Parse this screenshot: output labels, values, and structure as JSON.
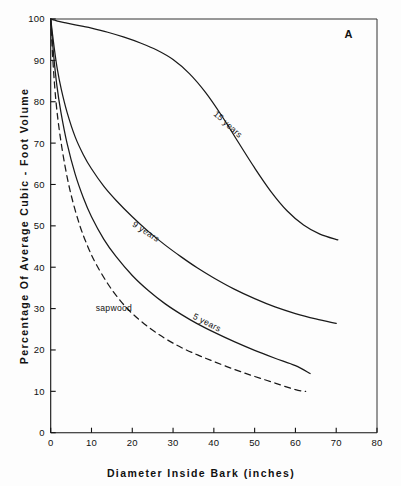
{
  "figure": {
    "panel_label": "A",
    "background_color": "#fdfdfd",
    "line_color": "#1a1a1a"
  },
  "chart_data": {
    "type": "line",
    "title": "",
    "xlabel": "Diameter Inside Bark  (inches)",
    "ylabel": "Percentage Of  Average Cubic - Foot  Volume",
    "xlim": [
      0,
      80
    ],
    "ylim": [
      0,
      100
    ],
    "xticks": [
      0,
      10,
      20,
      30,
      40,
      50,
      60,
      70,
      80
    ],
    "xticklabels": [
      "0",
      "10",
      "20",
      "30",
      "40",
      "50",
      "60",
      "70",
      "80"
    ],
    "yticks": [
      0,
      10,
      20,
      30,
      40,
      50,
      60,
      70,
      80,
      90,
      100
    ],
    "yticklabels": [
      "0",
      "10",
      "20",
      "30",
      "40",
      "50",
      "60",
      "70",
      "80",
      "90",
      "100"
    ],
    "grid": false,
    "legend": "inline-curve-labels",
    "annotations": [
      {
        "text": "A",
        "x": 73,
        "y": 95.5
      }
    ],
    "series": [
      {
        "name": "15 years",
        "label": "15 years",
        "style": "solid",
        "label_x": 43,
        "label_y": 74,
        "label_rotation": 42,
        "x": [
          0,
          1,
          2,
          4,
          6,
          8,
          10,
          14,
          18,
          22,
          26,
          30,
          34,
          38,
          42,
          46,
          50,
          54,
          58,
          62,
          66,
          70.4
        ],
        "y": [
          100,
          99.7,
          99.4,
          99.0,
          98.6,
          98.2,
          97.8,
          96.8,
          95.6,
          94.2,
          92.5,
          90.2,
          86.8,
          82.2,
          76.5,
          70.2,
          64.0,
          58.3,
          53.6,
          50.2,
          48.0,
          46.6
        ]
      },
      {
        "name": "9 years",
        "label": "9 years",
        "style": "solid",
        "label_x": 23,
        "label_y": 48,
        "label_rotation": 33,
        "x": [
          0,
          0.8,
          1.6,
          2.6,
          4,
          6,
          8,
          10,
          13,
          16,
          20,
          24,
          28,
          32,
          36,
          40,
          45,
          50,
          55,
          60,
          65,
          70
        ],
        "y": [
          100,
          93.5,
          88.0,
          83.0,
          77.5,
          71.5,
          67.2,
          63.8,
          59.6,
          56.2,
          52.2,
          48.6,
          45.4,
          42.5,
          39.8,
          37.4,
          34.7,
          32.4,
          30.4,
          28.8,
          27.5,
          26.4
        ]
      },
      {
        "name": "5 years",
        "label": "5 years",
        "style": "solid",
        "label_x": 38,
        "label_y": 26,
        "label_rotation": 27,
        "x": [
          0,
          0.7,
          1.5,
          2.5,
          4,
          6,
          8,
          10,
          13,
          16,
          20,
          24,
          28,
          32,
          36,
          40,
          45,
          50,
          55,
          60,
          63.6
        ],
        "y": [
          100,
          91.5,
          84.0,
          77.5,
          70.0,
          62.5,
          56.8,
          52.2,
          46.8,
          42.6,
          38.0,
          34.3,
          31.2,
          28.6,
          26.3,
          24.3,
          22.0,
          19.9,
          18.0,
          16.2,
          14.3
        ]
      },
      {
        "name": "sapwood",
        "label": "sapwood",
        "style": "dashed",
        "label_x": 15.5,
        "label_y": 29.5,
        "label_rotation": 0,
        "x": [
          0,
          0.6,
          1.3,
          2.2,
          3.5,
          5,
          7,
          9,
          11,
          14,
          17,
          20,
          24,
          28,
          32,
          36,
          40,
          45,
          50,
          55,
          60,
          62.5
        ],
        "y": [
          100,
          89.0,
          80.0,
          72.5,
          64.5,
          57.5,
          50.5,
          45.2,
          41.0,
          36.0,
          32.0,
          28.8,
          25.5,
          22.8,
          20.6,
          18.8,
          17.2,
          15.3,
          13.6,
          12.0,
          10.4,
          10.0
        ]
      }
    ]
  }
}
